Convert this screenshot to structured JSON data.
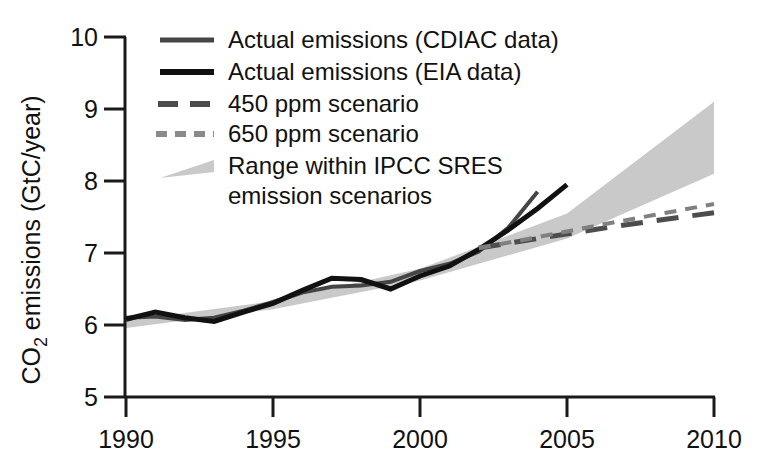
{
  "chart_data": {
    "type": "line",
    "title": "",
    "xlabel": "",
    "ylabel_parts": {
      "pre": "CO",
      "sub": "2",
      "post": " emissions (GtC/year)"
    },
    "ylabel": "CO2 emissions (GtC/year)",
    "xlim": [
      1990,
      2010
    ],
    "ylim": [
      5,
      10
    ],
    "xticks": [
      1990,
      1995,
      2000,
      2005,
      2010
    ],
    "xtick_labels": [
      "1990",
      "1995",
      "2000",
      "2005",
      "2010"
    ],
    "yticks": [
      5,
      6,
      7,
      8,
      9,
      10
    ],
    "ytick_labels": [
      "5",
      "6",
      "7",
      "8",
      "9",
      "10"
    ],
    "grid": false,
    "legend_position": "upper-left-inside",
    "series": [
      {
        "name": "Actual emissions (CDIAC data)",
        "style": "solid",
        "color": "#454545",
        "width": 4,
        "x": [
          1990,
          1991,
          1992,
          1993,
          1994,
          1995,
          1996,
          1997,
          1998,
          1999,
          2000,
          2001,
          2002,
          2003,
          2004
        ],
        "values": [
          6.1,
          6.12,
          6.07,
          6.1,
          6.2,
          6.32,
          6.45,
          6.53,
          6.55,
          6.6,
          6.75,
          6.85,
          7.02,
          7.35,
          7.85
        ]
      },
      {
        "name": "Actual emissions (EIA data)",
        "style": "solid",
        "color": "#111111",
        "width": 5,
        "x": [
          1990,
          1991,
          1992,
          1993,
          1994,
          1995,
          1996,
          1997,
          1998,
          1999,
          2000,
          2001,
          2002,
          2003,
          2004,
          2005
        ],
        "values": [
          6.08,
          6.18,
          6.1,
          6.05,
          6.18,
          6.3,
          6.48,
          6.65,
          6.63,
          6.5,
          6.68,
          6.82,
          7.05,
          7.32,
          7.62,
          7.95
        ]
      },
      {
        "name": "450 ppm scenario",
        "style": "dashed-long",
        "color": "#4d4d4d",
        "width": 5,
        "x": [
          2002,
          2004,
          2006,
          2008,
          2010
        ],
        "values": [
          7.07,
          7.2,
          7.33,
          7.45,
          7.56
        ]
      },
      {
        "name": "650 ppm scenario",
        "style": "dashed-short",
        "color": "#808080",
        "width": 4,
        "x": [
          2002,
          2004,
          2006,
          2008,
          2010
        ],
        "values": [
          7.07,
          7.22,
          7.38,
          7.53,
          7.68
        ]
      }
    ],
    "band": {
      "name": "Range within IPCC SRES emission scenarios",
      "color": "#c9c9c9",
      "x": [
        1990,
        1995,
        2000,
        2005,
        2010
      ],
      "lower": [
        5.96,
        6.22,
        6.62,
        7.2,
        8.1
      ],
      "upper": [
        6.06,
        6.33,
        6.78,
        7.55,
        9.1
      ]
    },
    "annotations": []
  },
  "legend": {
    "items": [
      {
        "label": "Actual emissions (CDIAC data)",
        "swatch": "line-dark-gray",
        "line2": ""
      },
      {
        "label": "Actual emissions (EIA data)",
        "swatch": "line-black",
        "line2": ""
      },
      {
        "label": "450 ppm scenario",
        "swatch": "dash-long-gray",
        "line2": ""
      },
      {
        "label": "650 ppm scenario",
        "swatch": "dash-short-gray",
        "line2": ""
      },
      {
        "label": "Range within IPCC SRES",
        "swatch": "wedge-gray",
        "line2": "emission scenarios"
      }
    ]
  }
}
